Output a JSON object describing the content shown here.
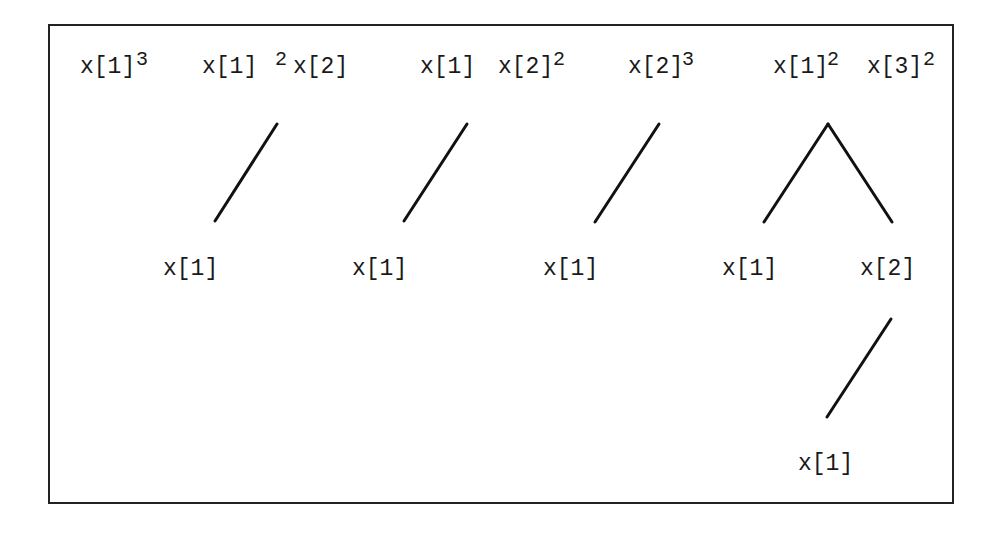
{
  "diagram": {
    "type": "tree-list",
    "trees": [
      {
        "root": {
          "terms": [
            {
              "base": "x[1]",
              "exponent": "3"
            }
          ]
        },
        "children": []
      },
      {
        "root": {
          "terms": [
            {
              "base": "x[1]",
              "exponent": "2"
            },
            {
              "base": "x[2]",
              "exponent": ""
            }
          ]
        },
        "children": [
          {
            "label": "x[1]"
          }
        ]
      },
      {
        "root": {
          "terms": [
            {
              "base": "x[1]",
              "exponent": ""
            },
            {
              "base": "x[2]",
              "exponent": "2"
            }
          ]
        },
        "children": [
          {
            "label": "x[1]"
          }
        ]
      },
      {
        "root": {
          "terms": [
            {
              "base": "x[2]",
              "exponent": "3"
            }
          ]
        },
        "children": [
          {
            "label": "x[1]"
          }
        ]
      },
      {
        "root": {
          "terms": [
            {
              "base": "x[1]",
              "exponent": "2"
            },
            {
              "base": "x[3]",
              "exponent": "2"
            }
          ]
        },
        "children": [
          {
            "label": "x[1]"
          },
          {
            "label": "x[2]",
            "children": [
              {
                "label": "x[1]"
              }
            ]
          }
        ]
      }
    ]
  },
  "labels": {
    "t1_base": "x[1]",
    "t1_exp": "3",
    "t2_base1": "x[1]",
    "t2_exp1": "2",
    "t2_base2": "x[2]",
    "t2_child": "x[1]",
    "t3_base1": "x[1]",
    "t3_base2": "x[2]",
    "t3_exp2": "2",
    "t3_child": "x[1]",
    "t4_base": "x[2]",
    "t4_exp": "3",
    "t4_child": "x[1]",
    "t5_base1": "x[1]",
    "t5_exp1": "2",
    "t5_base2": "x[3]",
    "t5_exp2": "2",
    "t5_child_left": "x[1]",
    "t5_child_right": "x[2]",
    "t5_grandchild": "x[1]"
  },
  "colors": {
    "line": "#111111",
    "border": "#222222",
    "background": "#ffffff"
  }
}
